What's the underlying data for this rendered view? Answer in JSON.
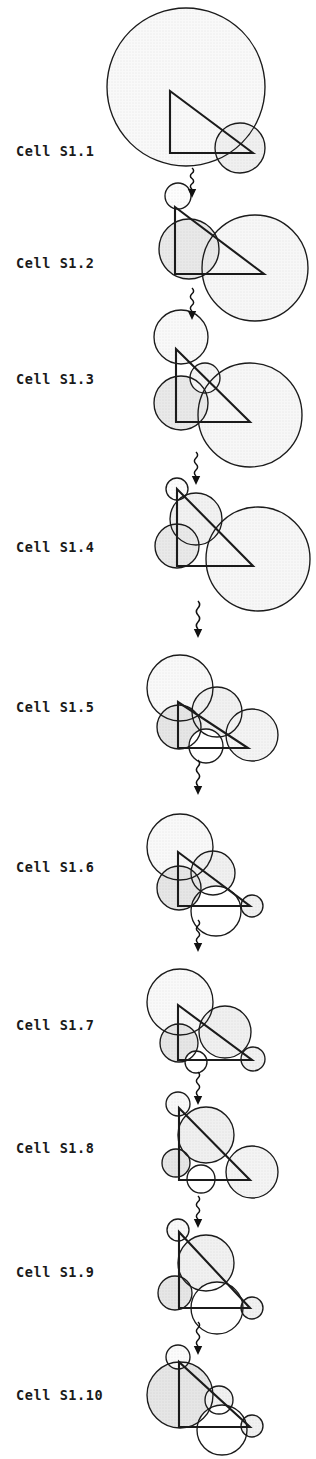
{
  "figure": {
    "width": 316,
    "height": 1459,
    "background": "#ffffff",
    "stroke_color": "#1b1b1b",
    "palette": {
      "white": "#ffffff",
      "very_light_gray": "#f2f2f2",
      "light_gray": "#e4e4e4",
      "mid_gray": "#d6d6d6",
      "dark_gray": "#c2c2c2",
      "outline": "#1b1b1b"
    },
    "connector": {
      "name": "wavy-down-arrow",
      "count": 9,
      "description": "wavy vertical line with solid downward arrowhead"
    }
  },
  "labels": [
    {
      "id": "s1-1",
      "text": "Cell S1.1",
      "x": 16,
      "y": 155
    },
    {
      "id": "s1-2",
      "text": "Cell S1.2",
      "x": 16,
      "y": 267
    },
    {
      "id": "s1-3",
      "text": "Cell S1.3",
      "x": 16,
      "y": 383
    },
    {
      "id": "s1-4",
      "text": "Cell S1.4",
      "x": 16,
      "y": 551
    },
    {
      "id": "s1-5",
      "text": "Cell S1.5",
      "x": 16,
      "y": 711
    },
    {
      "id": "s1-6",
      "text": "Cell S1.6",
      "x": 16,
      "y": 871
    },
    {
      "id": "s1-7",
      "text": "Cell S1.7",
      "x": 16,
      "y": 1029
    },
    {
      "id": "s1-8",
      "text": "Cell S1.8",
      "x": 16,
      "y": 1152
    },
    {
      "id": "s1-9",
      "text": "Cell S1.9",
      "x": 16,
      "y": 1276
    },
    {
      "id": "s1-10",
      "text": "Cell S1.10",
      "x": 16,
      "y": 1399
    }
  ],
  "cells": [
    {
      "id": "s1-1",
      "label": "Cell S1.1",
      "triangle": [
        [
          170,
          91
        ],
        [
          170,
          153
        ],
        [
          253,
          153
        ]
      ],
      "circles": [
        {
          "cx": 186,
          "cy": 87,
          "r": 79,
          "fill": "#f2f2f2"
        },
        {
          "cx": 240,
          "cy": 148,
          "r": 25,
          "fill": "#e0e0e0"
        }
      ]
    },
    {
      "id": "s1-2",
      "label": "Cell S1.2",
      "triangle": [
        [
          175,
          207
        ],
        [
          175,
          274
        ],
        [
          264,
          274
        ]
      ],
      "circles": [
        {
          "cx": 255,
          "cy": 268,
          "r": 53,
          "fill": "#eeeeee"
        },
        {
          "cx": 189,
          "cy": 249,
          "r": 30,
          "fill": "#d2d2d2"
        },
        {
          "cx": 178,
          "cy": 196,
          "r": 13,
          "fill": "#fbfbfb"
        }
      ]
    },
    {
      "id": "s1-3",
      "label": "Cell S1.3",
      "triangle": [
        [
          176,
          349
        ],
        [
          176,
          422
        ],
        [
          250,
          422
        ]
      ],
      "circles": [
        {
          "cx": 250,
          "cy": 415,
          "r": 52,
          "fill": "#eeeeee"
        },
        {
          "cx": 181,
          "cy": 403,
          "r": 27,
          "fill": "#d2d2d2"
        },
        {
          "cx": 181,
          "cy": 337,
          "r": 27,
          "fill": "#f2f2f2"
        },
        {
          "cx": 205,
          "cy": 378,
          "r": 15,
          "fill": "#eaeaea"
        }
      ]
    },
    {
      "id": "s1-4",
      "label": "Cell S1.4",
      "triangle": [
        [
          177,
          489
        ],
        [
          177,
          566
        ],
        [
          253,
          566
        ]
      ],
      "circles": [
        {
          "cx": 258,
          "cy": 559,
          "r": 52,
          "fill": "#eeeeee"
        },
        {
          "cx": 196,
          "cy": 519,
          "r": 26,
          "fill": "#e4e4e4"
        },
        {
          "cx": 177,
          "cy": 546,
          "r": 22,
          "fill": "#d2d2d2"
        },
        {
          "cx": 177,
          "cy": 489,
          "r": 11,
          "fill": "#fbfbfb"
        }
      ]
    },
    {
      "id": "s1-5",
      "label": "Cell S1.5",
      "triangle": [
        [
          178,
          702
        ],
        [
          178,
          748
        ],
        [
          248,
          748
        ]
      ],
      "circles": [
        {
          "cx": 180,
          "cy": 688,
          "r": 33,
          "fill": "#f2f2f2"
        },
        {
          "cx": 217,
          "cy": 712,
          "r": 25,
          "fill": "#e2e2e2"
        },
        {
          "cx": 252,
          "cy": 735,
          "r": 26,
          "fill": "#e8e8e8"
        },
        {
          "cx": 179,
          "cy": 727,
          "r": 22,
          "fill": "#cccccc"
        },
        {
          "cx": 206,
          "cy": 746,
          "r": 17,
          "fill": "#ffffff"
        }
      ]
    },
    {
      "id": "s1-6",
      "label": "Cell S1.6",
      "triangle": [
        [
          178,
          852
        ],
        [
          178,
          906
        ],
        [
          250,
          906
        ]
      ],
      "circles": [
        {
          "cx": 180,
          "cy": 847,
          "r": 33,
          "fill": "#f2f2f2"
        },
        {
          "cx": 213,
          "cy": 873,
          "r": 22,
          "fill": "#e0e0e0"
        },
        {
          "cx": 216,
          "cy": 911,
          "r": 25,
          "fill": "#ffffff"
        },
        {
          "cx": 179,
          "cy": 888,
          "r": 22,
          "fill": "#cccccc"
        },
        {
          "cx": 252,
          "cy": 906,
          "r": 11,
          "fill": "#e2e2e2"
        }
      ]
    },
    {
      "id": "s1-7",
      "label": "Cell S1.7",
      "triangle": [
        [
          178,
          1005
        ],
        [
          178,
          1060
        ],
        [
          252,
          1060
        ]
      ],
      "circles": [
        {
          "cx": 180,
          "cy": 1002,
          "r": 33,
          "fill": "#f2f2f2"
        },
        {
          "cx": 225,
          "cy": 1032,
          "r": 26,
          "fill": "#e0e0e0"
        },
        {
          "cx": 179,
          "cy": 1043,
          "r": 19,
          "fill": "#cccccc"
        },
        {
          "cx": 196,
          "cy": 1062,
          "r": 11,
          "fill": "#ffffff"
        },
        {
          "cx": 253,
          "cy": 1059,
          "r": 12,
          "fill": "#e2e2e2"
        }
      ]
    },
    {
      "id": "s1-8",
      "label": "Cell S1.8",
      "triangle": [
        [
          179,
          1108
        ],
        [
          179,
          1180
        ],
        [
          250,
          1180
        ]
      ],
      "circles": [
        {
          "cx": 206,
          "cy": 1135,
          "r": 28,
          "fill": "#e0e0e0"
        },
        {
          "cx": 252,
          "cy": 1172,
          "r": 26,
          "fill": "#e8e8e8"
        },
        {
          "cx": 176,
          "cy": 1163,
          "r": 14,
          "fill": "#cccccc"
        },
        {
          "cx": 201,
          "cy": 1179,
          "r": 14,
          "fill": "#ffffff"
        },
        {
          "cx": 178,
          "cy": 1104,
          "r": 12,
          "fill": "#f2f2f2"
        }
      ]
    },
    {
      "id": "s1-9",
      "label": "Cell S1.9",
      "triangle": [
        [
          179,
          1232
        ],
        [
          179,
          1308
        ],
        [
          250,
          1308
        ]
      ],
      "circles": [
        {
          "cx": 206,
          "cy": 1263,
          "r": 28,
          "fill": "#e2e2e2"
        },
        {
          "cx": 217,
          "cy": 1308,
          "r": 26,
          "fill": "#ffffff"
        },
        {
          "cx": 175,
          "cy": 1293,
          "r": 17,
          "fill": "#cccccc"
        },
        {
          "cx": 252,
          "cy": 1308,
          "r": 11,
          "fill": "#e2e2e2"
        },
        {
          "cx": 178,
          "cy": 1230,
          "r": 11,
          "fill": "#f2f2f2"
        }
      ]
    },
    {
      "id": "s1-10",
      "label": "Cell S1.10",
      "triangle": [
        [
          179,
          1362
        ],
        [
          179,
          1427
        ],
        [
          250,
          1427
        ]
      ],
      "circles": [
        {
          "cx": 180,
          "cy": 1395,
          "r": 33,
          "fill": "#cccccc"
        },
        {
          "cx": 219,
          "cy": 1400,
          "r": 14,
          "fill": "#e2e2e2"
        },
        {
          "cx": 222,
          "cy": 1430,
          "r": 25,
          "fill": "#ffffff"
        },
        {
          "cx": 252,
          "cy": 1426,
          "r": 11,
          "fill": "#e2e2e2"
        },
        {
          "cx": 178,
          "cy": 1357,
          "r": 12,
          "fill": "#f7f7f7"
        }
      ]
    }
  ],
  "connectors": [
    {
      "x": 192,
      "y_top": 168,
      "y_bottom": 198
    },
    {
      "x": 192,
      "y_top": 288,
      "y_bottom": 320
    },
    {
      "x": 196,
      "y_top": 452,
      "y_bottom": 485
    },
    {
      "x": 198,
      "y_top": 601,
      "y_bottom": 638
    },
    {
      "x": 198,
      "y_top": 760,
      "y_bottom": 795
    },
    {
      "x": 198,
      "y_top": 920,
      "y_bottom": 952
    },
    {
      "x": 198,
      "y_top": 1072,
      "y_bottom": 1105
    },
    {
      "x": 198,
      "y_top": 1196,
      "y_bottom": 1228
    },
    {
      "x": 198,
      "y_top": 1322,
      "y_bottom": 1355
    }
  ]
}
